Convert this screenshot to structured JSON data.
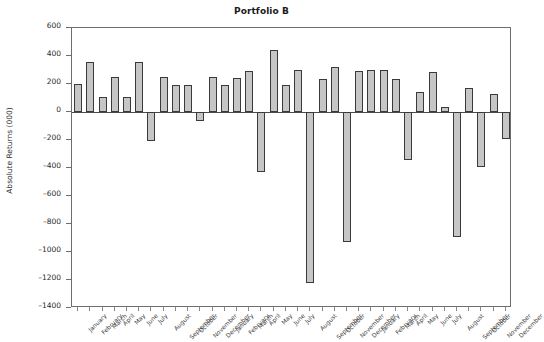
{
  "chart_data": {
    "type": "bar",
    "title": "Portfolio B",
    "xlabel": "",
    "ylabel": "Absolute Returns (000)",
    "ylim": [
      -1400,
      600
    ],
    "yticks": [
      600,
      400,
      200,
      0,
      -200,
      -400,
      -600,
      -800,
      -1000,
      -1200,
      -1400
    ],
    "grid": false,
    "legend": null,
    "bar_fill_color": "#c6c6c6",
    "bar_edge_color": "#3a3a3a",
    "categories": [
      "January",
      "February",
      "March",
      "April",
      "May",
      "June",
      "July",
      "August",
      "September",
      "October",
      "November",
      "December",
      "January",
      "February",
      "March",
      "April",
      "May",
      "June",
      "July",
      "August",
      "September",
      "October",
      "November",
      "December",
      "January",
      "February",
      "March",
      "April",
      "May",
      "June",
      "July",
      "August",
      "September",
      "October",
      "November",
      "December"
    ],
    "values": [
      200,
      355,
      110,
      250,
      105,
      355,
      -205,
      250,
      195,
      190,
      -65,
      250,
      195,
      240,
      295,
      -425,
      445,
      190,
      300,
      -1220,
      235,
      320,
      -930,
      295,
      300,
      300,
      235,
      -340,
      140,
      285,
      35,
      -890,
      175,
      -395,
      130,
      -195
    ]
  }
}
